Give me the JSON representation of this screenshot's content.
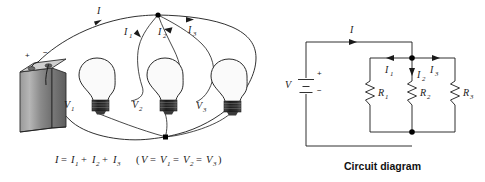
{
  "figure": {
    "background_color": "#ffffff",
    "line_color": "#1a1a1a"
  },
  "pictorial": {
    "name": "pictorial-parallel-circuit",
    "battery": {
      "label_positive": "+",
      "label_negative": "−",
      "body_color": "#8d8d8d",
      "side_color": "#6a6a6a",
      "top_color": "#c9c9c9"
    },
    "current_labels": [
      {
        "text": "I",
        "sub": ""
      },
      {
        "text": "I",
        "sub": "1"
      },
      {
        "text": "I",
        "sub": "2"
      },
      {
        "text": "I",
        "sub": "3"
      }
    ],
    "bulbs": [
      {
        "label": "V",
        "sub": "1"
      },
      {
        "label": "V",
        "sub": "2"
      },
      {
        "label": "V",
        "sub": "3"
      }
    ],
    "equation": {
      "current": "I = I1 + I2 + I3",
      "voltage": "(V = V1 = V2 = V3)",
      "parts_current": [
        "I",
        "=",
        "I",
        "1",
        "+",
        "I",
        "2",
        "+",
        "I",
        "3"
      ],
      "parts_voltage": [
        "(",
        "V",
        "=",
        "V",
        "1",
        "=",
        "V",
        "2",
        "=",
        "V",
        "3",
        ")"
      ]
    }
  },
  "schematic": {
    "name": "circuit-diagram",
    "caption": "Circuit diagram",
    "source": {
      "label": "V",
      "positive": "+",
      "negative": "−"
    },
    "main_current": {
      "text": "I",
      "sub": ""
    },
    "branch_currents": [
      {
        "text": "I",
        "sub": "1"
      },
      {
        "text": "I",
        "sub": "2"
      },
      {
        "text": "I",
        "sub": "3"
      }
    ],
    "resistors": [
      {
        "label": "R",
        "sub": "1"
      },
      {
        "label": "R",
        "sub": "2"
      },
      {
        "label": "R",
        "sub": "3"
      }
    ]
  }
}
